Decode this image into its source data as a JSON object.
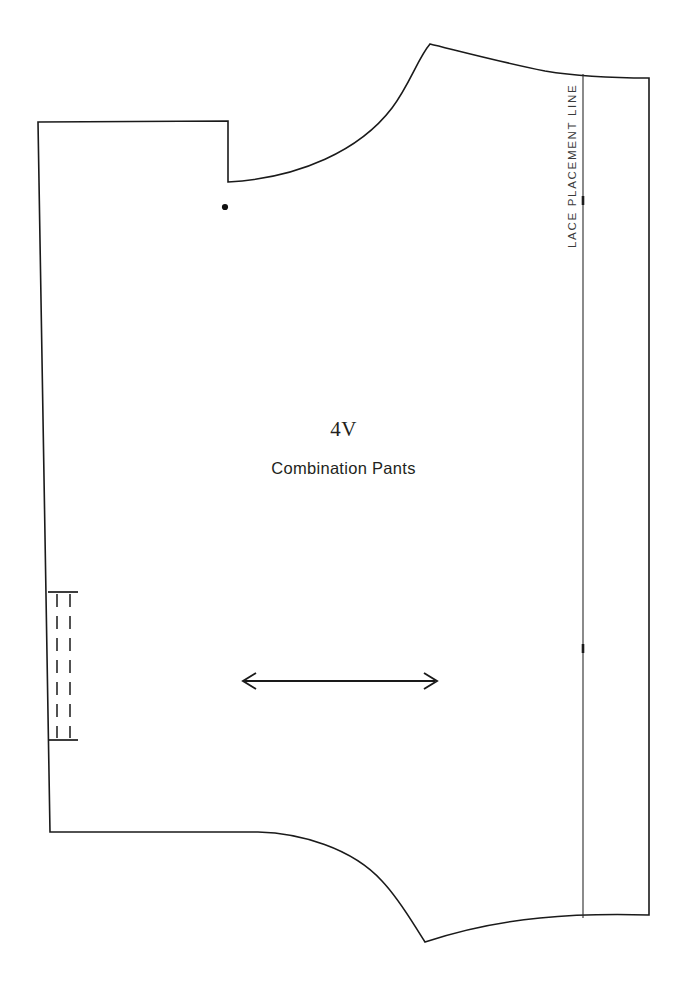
{
  "document": {
    "type": "sewing-pattern-piece",
    "background_color": "#ffffff",
    "ink_color": "#1a1a1a",
    "width": 687,
    "height": 983
  },
  "labels": {
    "piece_code": "4V",
    "piece_name": "Combination Pants",
    "lace_placement": "LACE PLACEMENT LINE"
  },
  "markings": {
    "grainline": {
      "name": "grainline-arrow",
      "description": "double-headed horizontal arrow",
      "x_start": 243,
      "x_end": 437,
      "y": 681
    },
    "notch_dot": {
      "name": "notch-dot",
      "x": 225,
      "y": 207,
      "radius": 3.1
    },
    "lace_line": {
      "name": "lace-placement-line",
      "x": 583,
      "y_top": 74,
      "y_bottom": 918,
      "ticks": [
        200,
        648
      ]
    },
    "placket": {
      "name": "button-placket-marking",
      "dash_lines_x": [
        57,
        70
      ],
      "y_top": 592,
      "y_bottom": 740,
      "rule_x_start": 48,
      "rule_x_end": 78
    }
  },
  "outline": {
    "name": "pattern-piece-outline",
    "path": "M 38 122 L 228 121 L 228 182 C 300 178 360 150 392 108 C 410 84 418 58 430 44 C 455 50 500 62 545 71 C 575 76 615 78 649 78 L 649 915 C 612 914 570 915 540 918 C 498 922 455 932 425 942 C 412 922 400 900 382 881 C 352 848 300 833 258 832 L 50 832 Z"
  }
}
